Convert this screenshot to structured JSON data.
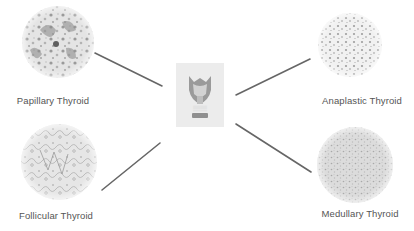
{
  "diagram": {
    "center": {
      "name": "thyroid-model",
      "icon": "thyroid-gland-icon"
    },
    "nodes": [
      {
        "id": "papillary",
        "label": "Papillary Thyroid",
        "position": "top-left",
        "texture": "papillary-histology"
      },
      {
        "id": "anaplastic",
        "label": "Anaplastic Thyroid",
        "position": "top-right",
        "texture": "anaplastic-histology"
      },
      {
        "id": "follicular",
        "label": "Follicular Thyroid",
        "position": "bottom-left",
        "texture": "follicular-histology"
      },
      {
        "id": "medullary",
        "label": "Medullary Thyroid",
        "position": "bottom-right",
        "texture": "medullary-histology"
      }
    ],
    "edges": [
      {
        "from": "papillary",
        "to": "center"
      },
      {
        "from": "follicular",
        "to": "center"
      },
      {
        "from": "anaplastic",
        "to": "center"
      },
      {
        "from": "medullary",
        "to": "center"
      }
    ],
    "colors": {
      "line": "#666666",
      "label": "#555555",
      "tissue_dark": "#8a8a8a",
      "tissue_light": "#d9d9d9",
      "center_bg": "#ececec"
    }
  }
}
